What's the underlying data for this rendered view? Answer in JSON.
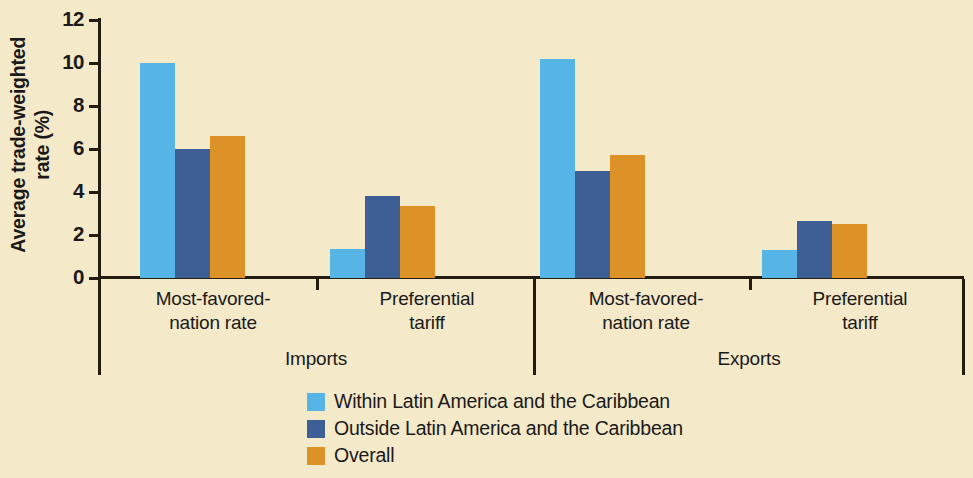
{
  "chart_data": {
    "type": "bar",
    "title": "",
    "xlabel": "",
    "ylabel_line1": "Average trade-weighted",
    "ylabel_line2": "rate (%)",
    "ylim": [
      0,
      12
    ],
    "yticks": [
      0,
      2,
      4,
      6,
      8,
      10,
      12
    ],
    "grid": false,
    "legend_position": "bottom",
    "panels": [
      {
        "name": "Imports",
        "groups": [
          {
            "label_line1": "Most-favored-",
            "label_line2": "nation rate",
            "values": [
              10.0,
              6.0,
              6.6
            ]
          },
          {
            "label_line1": "Preferential",
            "label_line2": "tariff",
            "values": [
              1.35,
              3.8,
              3.35
            ]
          }
        ]
      },
      {
        "name": "Exports",
        "groups": [
          {
            "label_line1": "Most-favored-",
            "label_line2": "nation rate",
            "values": [
              10.2,
              5.0,
              5.7
            ]
          },
          {
            "label_line1": "Preferential",
            "label_line2": "tariff",
            "values": [
              1.3,
              2.65,
              2.5
            ]
          }
        ]
      }
    ],
    "series": [
      {
        "name": "Within Latin America and the Caribbean",
        "color": "#57b5e6"
      },
      {
        "name": "Outside Latin America and the Caribbean",
        "color": "#3d5f95"
      },
      {
        "name": "Overall",
        "color": "#dd9228"
      }
    ],
    "categories": [
      "Imports - Most-favored-nation rate",
      "Imports - Preferential tariff",
      "Exports - Most-favored-nation rate",
      "Exports - Preferential tariff"
    ],
    "background_color": "#f4e9c8",
    "axis_color": "#241c10"
  },
  "legend": {
    "items": [
      {
        "label": "Within Latin America and the Caribbean",
        "color": "#57b5e6"
      },
      {
        "label": "Outside Latin America and the Caribbean",
        "color": "#3d5f95"
      },
      {
        "label": "Overall",
        "color": "#dd9228"
      }
    ]
  },
  "yticks": {
    "t0": "0",
    "t1": "2",
    "t2": "4",
    "t3": "6",
    "t4": "8",
    "t5": "10",
    "t6": "12"
  }
}
